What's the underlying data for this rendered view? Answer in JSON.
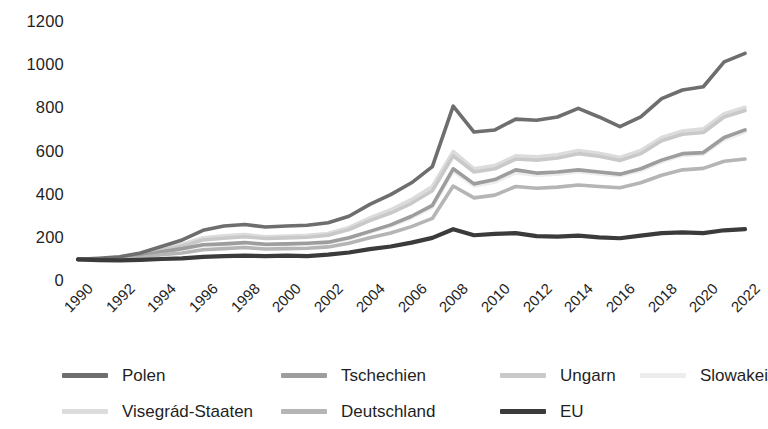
{
  "chart_data": {
    "type": "line",
    "title": "",
    "xlabel": "",
    "ylabel": "",
    "grid": false,
    "legend_position": "bottom",
    "xlim": [
      1990,
      2022
    ],
    "ylim": [
      0,
      1200
    ],
    "ytick_values": [
      1200,
      1000,
      800,
      600,
      400,
      200,
      0
    ],
    "ytick_labels": [
      "1200",
      "1000",
      "800",
      "600",
      "400",
      "200",
      "0"
    ],
    "xtick_labels": [
      "1990",
      "1992",
      "1994",
      "1996",
      "1998",
      "2000",
      "2002",
      "2004",
      "2006",
      "2008",
      "2010",
      "2012",
      "2014",
      "2016",
      "2018",
      "2020",
      "2022"
    ],
    "x": [
      1990,
      1991,
      1992,
      1993,
      1994,
      1995,
      1996,
      1997,
      1998,
      1999,
      2000,
      2001,
      2002,
      2003,
      2004,
      2005,
      2006,
      2007,
      2008,
      2009,
      2010,
      2011,
      2012,
      2013,
      2014,
      2015,
      2016,
      2017,
      2018,
      2019,
      2020,
      2021,
      2022
    ],
    "series": [
      {
        "name": "Polen",
        "color": "#6e6e6e",
        "values": [
          100,
          105,
          112,
          130,
          160,
          190,
          235,
          255,
          262,
          250,
          255,
          258,
          270,
          300,
          355,
          400,
          455,
          530,
          810,
          690,
          700,
          750,
          745,
          760,
          800,
          760,
          715,
          760,
          845,
          885,
          900,
          1015,
          1055
        ]
      },
      {
        "name": "Tschechien",
        "color": "#9d9d9d",
        "values": [
          100,
          100,
          104,
          116,
          135,
          150,
          168,
          172,
          178,
          170,
          172,
          175,
          180,
          200,
          230,
          260,
          300,
          350,
          520,
          450,
          470,
          515,
          500,
          505,
          515,
          505,
          495,
          520,
          560,
          590,
          595,
          665,
          700
        ]
      },
      {
        "name": "Ungarn",
        "color": "#c9c9c9",
        "values": [
          100,
          100,
          106,
          120,
          142,
          162,
          190,
          198,
          205,
          197,
          200,
          203,
          212,
          238,
          280,
          315,
          360,
          418,
          580,
          505,
          520,
          565,
          560,
          570,
          590,
          578,
          558,
          590,
          650,
          680,
          688,
          760,
          790
        ]
      },
      {
        "name": "Slowakei",
        "color": "#ededed",
        "values": [
          100,
          99,
          103,
          114,
          132,
          148,
          164,
          168,
          174,
          166,
          168,
          170,
          176,
          196,
          226,
          255,
          293,
          342,
          508,
          440,
          458,
          502,
          490,
          495,
          506,
          496,
          488,
          512,
          552,
          582,
          588,
          655,
          690
        ]
      },
      {
        "name": "Visegrád-Staaten",
        "color": "#dcdcdc",
        "values": [
          100,
          100,
          108,
          124,
          150,
          170,
          200,
          210,
          215,
          205,
          208,
          212,
          220,
          248,
          292,
          330,
          378,
          438,
          600,
          520,
          535,
          580,
          575,
          585,
          605,
          592,
          572,
          605,
          665,
          695,
          705,
          775,
          805
        ]
      },
      {
        "name": "Deutschland",
        "color": "#b5b5b5",
        "values": [
          100,
          98,
          100,
          108,
          122,
          130,
          145,
          150,
          155,
          148,
          150,
          152,
          158,
          175,
          200,
          222,
          252,
          290,
          440,
          385,
          398,
          438,
          430,
          435,
          445,
          438,
          432,
          455,
          490,
          515,
          522,
          555,
          565
        ]
      },
      {
        "name": "EU",
        "color": "#3b3b3b",
        "values": [
          100,
          97,
          96,
          98,
          102,
          105,
          112,
          115,
          118,
          115,
          118,
          115,
          122,
          132,
          148,
          160,
          178,
          200,
          240,
          212,
          218,
          222,
          208,
          206,
          210,
          202,
          198,
          210,
          222,
          225,
          222,
          235,
          240
        ]
      }
    ]
  },
  "legend": {
    "row1": [
      {
        "label": "Polen",
        "color": "#6e6e6e"
      },
      {
        "label": "Tschechien",
        "color": "#9d9d9d"
      },
      {
        "label": "Ungarn",
        "color": "#c9c9c9"
      },
      {
        "label": "Slowakei",
        "color": "#ededed"
      }
    ],
    "row2": [
      {
        "label": "Visegrád-Staaten",
        "color": "#dcdcdc"
      },
      {
        "label": "Deutschland",
        "color": "#b5b5b5"
      },
      {
        "label": "EU",
        "color": "#3b3b3b"
      }
    ]
  }
}
